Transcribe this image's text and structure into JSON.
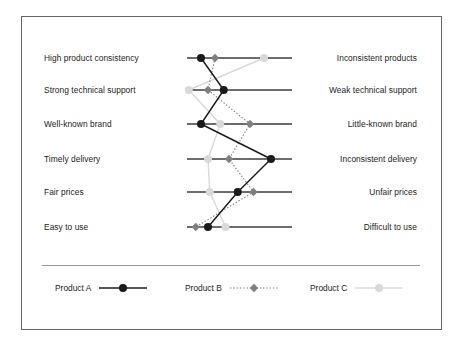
{
  "chart_data": {
    "type": "line",
    "chart_kind": "semantic-differential-profile",
    "title": "",
    "xlabel": "",
    "ylabel": "",
    "grid": false,
    "legend_position": "bottom",
    "scale": {
      "min": 1,
      "max": 7,
      "left_anchor_value": 1,
      "right_anchor_value": 7
    },
    "categories": [
      "High product consistency",
      "Strong technical support",
      "Well-known brand",
      "Timely delivery",
      "Fair prices",
      "Easy to use"
    ],
    "left_labels": [
      "High product consistency",
      "Strong technical support",
      "Well-known brand",
      "Timely delivery",
      "Fair prices",
      "Easy to use"
    ],
    "right_labels": [
      "Inconsistent products",
      "Weak technical support",
      "Little-known brand",
      "Inconsistent delivery",
      "Unfair prices",
      "Difficult to use"
    ],
    "series": [
      {
        "name": "Product A",
        "color": "#1a1a1a",
        "marker": "circle",
        "line_style": "solid",
        "values": [
          1.8,
          3.1,
          1.8,
          5.8,
          3.9,
          2.2
        ]
      },
      {
        "name": "Product B",
        "color": "#7f7f7f",
        "marker": "diamond",
        "line_style": "dotted",
        "values": [
          2.6,
          2.2,
          4.6,
          3.4,
          4.8,
          1.5
        ]
      },
      {
        "name": "Product C",
        "color": "#d9d9d9",
        "marker": "circle",
        "line_style": "solid",
        "values": [
          5.4,
          1.1,
          2.9,
          2.2,
          2.3,
          3.2
        ]
      }
    ]
  },
  "legend": {
    "items": [
      {
        "label": "Product A"
      },
      {
        "label": "Product B"
      },
      {
        "label": "Product C"
      }
    ]
  },
  "colors": {
    "frame_border": "#666666",
    "axis_line": "#3c3c3c",
    "divider": "#9a9a9a",
    "text": "#1c1c1c",
    "product_a": "#1a1a1a",
    "product_b": "#7f7f7f",
    "product_c": "#d9d9d9",
    "background": "#ffffff"
  }
}
